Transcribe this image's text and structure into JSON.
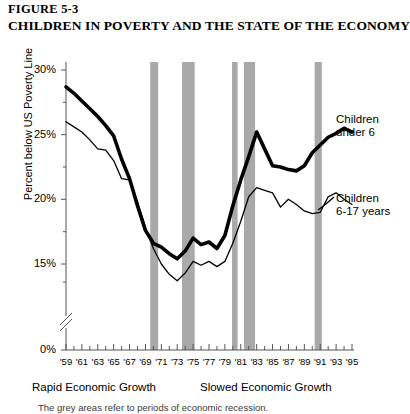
{
  "figure": {
    "number": "FIGURE 5-3",
    "title": "CHILDREN IN POVERTY AND THE STATE OF THE ECONOMY",
    "footnote": "The grey areas refer to periods of economic recession."
  },
  "annotations": {
    "era_left": "Rapid Economic Growth",
    "era_right": "Slowed Economic Growth",
    "series_label_1_line1": "Children",
    "series_label_1_line2": "under 6",
    "series_label_2_line1": "Children",
    "series_label_2_line2": "6-17 years"
  },
  "colors": {
    "line": "#000000",
    "recession_band": "#9a9a9a",
    "axis": "#555555",
    "background": "#ffffff"
  },
  "chart_data": {
    "type": "line",
    "title": "CHILDREN IN POVERTY AND THE STATE OF THE ECONOMY",
    "xlabel": "",
    "ylabel": "Percent below US Poverty Line",
    "ylim": [
      15,
      30
    ],
    "y_axis_break": true,
    "y_zero_shown": "0%",
    "ytick_labels": [
      "30%",
      "25%",
      "20%",
      "15%",
      "0%"
    ],
    "ytick_values": [
      30,
      25,
      20,
      15,
      0
    ],
    "grid": false,
    "legend_position": "inline-right",
    "x": [
      1959,
      1960,
      1961,
      1962,
      1963,
      1964,
      1965,
      1966,
      1967,
      1968,
      1969,
      1970,
      1971,
      1972,
      1973,
      1974,
      1975,
      1976,
      1977,
      1978,
      1979,
      1980,
      1981,
      1982,
      1983,
      1984,
      1985,
      1986,
      1987,
      1988,
      1989,
      1990,
      1991,
      1992,
      1993,
      1994,
      1995
    ],
    "xtick_labels": [
      "'59",
      "'61",
      "'63",
      "'65",
      "'67",
      "'69",
      "'71",
      "'73",
      "'75",
      "'77",
      "'79",
      "'81",
      "'83",
      "'85",
      "'87",
      "'89",
      "'91",
      "'93",
      "'95"
    ],
    "xtick_values": [
      1959,
      1961,
      1963,
      1965,
      1967,
      1969,
      1971,
      1973,
      1975,
      1977,
      1979,
      1981,
      1983,
      1985,
      1987,
      1989,
      1991,
      1993,
      1995
    ],
    "series": [
      {
        "name": "Children under 6",
        "style": "thick",
        "values": [
          28.7,
          28.2,
          27.6,
          27.0,
          26.4,
          25.7,
          24.9,
          23.1,
          21.6,
          19.5,
          17.6,
          16.6,
          16.3,
          15.8,
          15.4,
          16.0,
          17.0,
          16.5,
          16.7,
          16.2,
          17.2,
          19.5,
          21.5,
          23.3,
          25.2,
          23.9,
          22.6,
          22.5,
          22.3,
          22.2,
          22.6,
          23.6,
          24.2,
          24.8,
          25.1,
          25.5,
          25.2
        ]
      },
      {
        "name": "Children 6-17 years",
        "style": "thin",
        "values": [
          26.0,
          25.6,
          25.2,
          24.6,
          23.9,
          23.8,
          23.0,
          21.6,
          21.5,
          19.8,
          17.8,
          16.2,
          15.0,
          14.2,
          13.7,
          14.3,
          15.2,
          14.9,
          15.2,
          14.8,
          15.2,
          16.6,
          18.3,
          20.2,
          20.9,
          20.7,
          20.5,
          19.4,
          20.0,
          19.6,
          19.1,
          18.9,
          19.0,
          20.2,
          20.5,
          20.0,
          19.6
        ]
      }
    ],
    "recession_bands": [
      {
        "start": 1969.6,
        "end": 1970.6
      },
      {
        "start": 1973.6,
        "end": 1975.2
      },
      {
        "start": 1979.9,
        "end": 1980.6
      },
      {
        "start": 1981.4,
        "end": 1982.8
      },
      {
        "start": 1990.3,
        "end": 1991.2
      }
    ],
    "recession_note": "Grey vertical bands mark recessions"
  }
}
